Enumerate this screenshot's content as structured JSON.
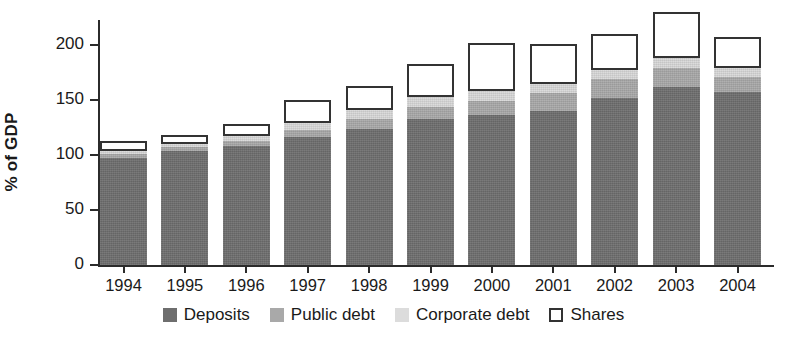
{
  "chart_data": {
    "type": "bar",
    "subtype": "stacked-bar",
    "title": "",
    "xlabel": "",
    "ylabel": "% of GDP",
    "ylim": [
      0,
      230
    ],
    "yticks": [
      0,
      50,
      100,
      150,
      200
    ],
    "ytick_labels": [
      "0",
      "50",
      "100",
      "150",
      "200"
    ],
    "grid": false,
    "legend_position": "bottom",
    "categories": [
      "1994",
      "1995",
      "1996",
      "1997",
      "1998",
      "1999",
      "2000",
      "2001",
      "2002",
      "2003",
      "2004"
    ],
    "series": [
      {
        "name": "Deposits",
        "color": "#6e6e6e",
        "values": [
          97,
          104,
          108,
          116,
          124,
          133,
          136,
          140,
          152,
          162,
          157
        ]
      },
      {
        "name": "Public debt",
        "color": "#a9a9a9",
        "values": [
          4,
          3,
          5,
          7,
          9,
          11,
          13,
          16,
          17,
          17,
          14
        ]
      },
      {
        "name": "Corporate debt",
        "color": "#d9d9d9",
        "values": [
          3,
          3,
          4,
          6,
          8,
          9,
          9,
          9,
          8,
          9,
          8
        ]
      },
      {
        "name": "Shares",
        "color": "#ffffff",
        "values": [
          9,
          8,
          11,
          21,
          22,
          30,
          44,
          36,
          33,
          42,
          28
        ]
      }
    ],
    "totals": [
      113,
      118,
      128,
      150,
      163,
      183,
      202,
      201,
      210,
      230,
      207
    ]
  },
  "legend": {
    "items": [
      {
        "label": "Deposits",
        "swatch": "deposits-swatch"
      },
      {
        "label": "Public debt",
        "swatch": "public-debt-swatch"
      },
      {
        "label": "Corporate debt",
        "swatch": "corporate-debt-swatch"
      },
      {
        "label": "Shares",
        "swatch": "shares-swatch"
      }
    ]
  }
}
